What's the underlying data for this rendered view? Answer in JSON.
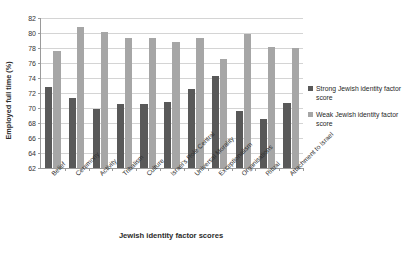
{
  "chart_data": {
    "type": "bar",
    "title": "",
    "xlabel": "Jewish identity factor scores",
    "ylabel": "Employed full time (%)",
    "ylim": [
      62,
      82
    ],
    "ytick_step": 2,
    "yticks": [
      62,
      64,
      66,
      68,
      70,
      72,
      74,
      76,
      78,
      80,
      82
    ],
    "grid": true,
    "legend_position": "right",
    "categories": [
      "Belief",
      "Ceremony",
      "Activity",
      "Tribalism",
      "Culture",
      "Israel's Role Central",
      "Universal Morality",
      "Exceptionalism",
      "Organisations",
      "Ritual",
      "Attachment to Israel"
    ],
    "series": [
      {
        "name": "Strong Jewish identity factor score",
        "color": "#595959",
        "values": [
          72.8,
          71.3,
          69.9,
          70.5,
          70.5,
          70.8,
          72.5,
          74.3,
          69.6,
          68.5,
          70.7
        ]
      },
      {
        "name": "Weak Jewish identity factor score",
        "color": "#a6a6a6",
        "values": [
          77.6,
          80.8,
          80.2,
          79.4,
          79.4,
          78.8,
          79.3,
          76.5,
          79.9,
          78.1,
          78.0
        ]
      }
    ]
  },
  "legend": {
    "entries": [
      {
        "label": "Strong Jewish identity factor score",
        "swatch": "strong"
      },
      {
        "label": "Weak Jewish identity factor score",
        "swatch": "weak"
      }
    ]
  }
}
